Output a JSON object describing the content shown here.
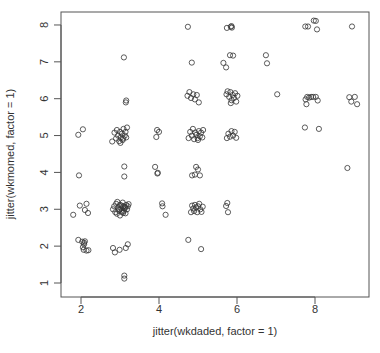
{
  "chart_data": {
    "type": "scatter",
    "title": "",
    "xlabel": "jitter(wkdaded, factor = 1)",
    "ylabel": "jitter(wkmomed, factor = 1)",
    "xlim": [
      1.5,
      9.4
    ],
    "ylim": [
      0.7,
      8.3
    ],
    "x_ticks": [
      2,
      4,
      6,
      8
    ],
    "y_ticks": [
      1,
      2,
      3,
      4,
      5,
      6,
      7,
      8
    ],
    "grid": false,
    "legend": null,
    "marker": "open-circle",
    "marker_color": "#333333",
    "points": [
      {
        "x": 1.8,
        "y": 2.85
      },
      {
        "x": 1.97,
        "y": 3.1
      },
      {
        "x": 2.1,
        "y": 2.98
      },
      {
        "x": 2.14,
        "y": 3.15
      },
      {
        "x": 2.18,
        "y": 2.9
      },
      {
        "x": 1.93,
        "y": 2.17
      },
      {
        "x": 2.03,
        "y": 2.12
      },
      {
        "x": 2.08,
        "y": 2.05
      },
      {
        "x": 2.1,
        "y": 2.13
      },
      {
        "x": 2.05,
        "y": 1.97
      },
      {
        "x": 2.07,
        "y": 1.9
      },
      {
        "x": 2.14,
        "y": 1.88
      },
      {
        "x": 2.19,
        "y": 1.89
      },
      {
        "x": 2.08,
        "y": 2.09
      },
      {
        "x": 1.95,
        "y": 3.92
      },
      {
        "x": 1.93,
        "y": 5.02
      },
      {
        "x": 2.05,
        "y": 5.17
      },
      {
        "x": 2.82,
        "y": 1.95
      },
      {
        "x": 2.87,
        "y": 1.83
      },
      {
        "x": 2.99,
        "y": 1.9
      },
      {
        "x": 3.15,
        "y": 1.95
      },
      {
        "x": 3.2,
        "y": 2.05
      },
      {
        "x": 3.11,
        "y": 1.2
      },
      {
        "x": 3.11,
        "y": 1.12
      },
      {
        "x": 2.82,
        "y": 3.0
      },
      {
        "x": 2.85,
        "y": 3.08
      },
      {
        "x": 2.88,
        "y": 2.92
      },
      {
        "x": 2.9,
        "y": 3.15
      },
      {
        "x": 2.92,
        "y": 2.88
      },
      {
        "x": 2.95,
        "y": 3.05
      },
      {
        "x": 2.97,
        "y": 2.97
      },
      {
        "x": 3.0,
        "y": 3.12
      },
      {
        "x": 3.0,
        "y": 2.83
      },
      {
        "x": 3.03,
        "y": 3.02
      },
      {
        "x": 3.05,
        "y": 2.93
      },
      {
        "x": 3.07,
        "y": 3.18
      },
      {
        "x": 3.09,
        "y": 3.08
      },
      {
        "x": 3.1,
        "y": 2.96
      },
      {
        "x": 3.12,
        "y": 3.03
      },
      {
        "x": 3.14,
        "y": 2.89
      },
      {
        "x": 3.16,
        "y": 3.12
      },
      {
        "x": 3.18,
        "y": 3.0
      },
      {
        "x": 3.2,
        "y": 3.08
      },
      {
        "x": 3.22,
        "y": 3.14
      },
      {
        "x": 2.93,
        "y": 3.2
      },
      {
        "x": 2.98,
        "y": 3.0
      },
      {
        "x": 3.04,
        "y": 3.1
      },
      {
        "x": 3.08,
        "y": 2.9
      },
      {
        "x": 3.13,
        "y": 3.06
      },
      {
        "x": 3.11,
        "y": 3.89
      },
      {
        "x": 3.11,
        "y": 4.16
      },
      {
        "x": 2.8,
        "y": 4.84
      },
      {
        "x": 2.86,
        "y": 5.08
      },
      {
        "x": 2.9,
        "y": 4.92
      },
      {
        "x": 2.92,
        "y": 5.15
      },
      {
        "x": 2.95,
        "y": 5.0
      },
      {
        "x": 2.98,
        "y": 4.85
      },
      {
        "x": 3.0,
        "y": 5.1
      },
      {
        "x": 3.02,
        "y": 4.95
      },
      {
        "x": 3.05,
        "y": 5.05
      },
      {
        "x": 3.07,
        "y": 4.88
      },
      {
        "x": 3.09,
        "y": 5.18
      },
      {
        "x": 3.12,
        "y": 5.0
      },
      {
        "x": 3.14,
        "y": 5.1
      },
      {
        "x": 3.16,
        "y": 4.95
      },
      {
        "x": 3.18,
        "y": 5.22
      },
      {
        "x": 3.01,
        "y": 4.8
      },
      {
        "x": 3.08,
        "y": 4.92
      },
      {
        "x": 3.15,
        "y": 5.9
      },
      {
        "x": 3.16,
        "y": 5.95
      },
      {
        "x": 3.1,
        "y": 7.12
      },
      {
        "x": 3.9,
        "y": 4.15
      },
      {
        "x": 3.96,
        "y": 3.97
      },
      {
        "x": 3.97,
        "y": 3.99
      },
      {
        "x": 4.08,
        "y": 3.16
      },
      {
        "x": 4.09,
        "y": 3.08
      },
      {
        "x": 4.17,
        "y": 2.85
      },
      {
        "x": 3.93,
        "y": 4.96
      },
      {
        "x": 3.95,
        "y": 5.15
      },
      {
        "x": 4.0,
        "y": 5.1
      },
      {
        "x": 4.75,
        "y": 2.17
      },
      {
        "x": 5.08,
        "y": 1.92
      },
      {
        "x": 4.82,
        "y": 2.92
      },
      {
        "x": 4.85,
        "y": 3.1
      },
      {
        "x": 4.88,
        "y": 3.02
      },
      {
        "x": 4.9,
        "y": 2.95
      },
      {
        "x": 4.92,
        "y": 3.12
      },
      {
        "x": 4.95,
        "y": 3.05
      },
      {
        "x": 4.98,
        "y": 2.92
      },
      {
        "x": 5.0,
        "y": 3.08
      },
      {
        "x": 5.03,
        "y": 3.15
      },
      {
        "x": 5.06,
        "y": 3.0
      },
      {
        "x": 5.09,
        "y": 2.93
      },
      {
        "x": 5.12,
        "y": 3.07
      },
      {
        "x": 4.85,
        "y": 3.92
      },
      {
        "x": 4.95,
        "y": 4.15
      },
      {
        "x": 5.0,
        "y": 4.08
      },
      {
        "x": 5.05,
        "y": 3.92
      },
      {
        "x": 4.92,
        "y": 3.94
      },
      {
        "x": 4.76,
        "y": 4.93
      },
      {
        "x": 4.8,
        "y": 5.1
      },
      {
        "x": 4.84,
        "y": 5.0
      },
      {
        "x": 4.87,
        "y": 5.18
      },
      {
        "x": 4.9,
        "y": 4.9
      },
      {
        "x": 4.93,
        "y": 5.08
      },
      {
        "x": 4.96,
        "y": 5.02
      },
      {
        "x": 4.99,
        "y": 4.93
      },
      {
        "x": 5.02,
        "y": 5.12
      },
      {
        "x": 5.05,
        "y": 4.98
      },
      {
        "x": 5.08,
        "y": 5.08
      },
      {
        "x": 5.11,
        "y": 4.95
      },
      {
        "x": 5.13,
        "y": 5.15
      },
      {
        "x": 5.0,
        "y": 4.88
      },
      {
        "x": 4.73,
        "y": 6.08
      },
      {
        "x": 4.78,
        "y": 6.18
      },
      {
        "x": 4.82,
        "y": 6.02
      },
      {
        "x": 4.88,
        "y": 6.12
      },
      {
        "x": 4.92,
        "y": 5.98
      },
      {
        "x": 4.97,
        "y": 6.1
      },
      {
        "x": 5.02,
        "y": 5.9
      },
      {
        "x": 4.74,
        "y": 7.95
      },
      {
        "x": 4.84,
        "y": 6.98
      },
      {
        "x": 5.65,
        "y": 6.97
      },
      {
        "x": 5.82,
        "y": 7.18
      },
      {
        "x": 5.9,
        "y": 7.17
      },
      {
        "x": 5.72,
        "y": 6.85
      },
      {
        "x": 5.74,
        "y": 7.92
      },
      {
        "x": 5.84,
        "y": 7.95
      },
      {
        "x": 5.86,
        "y": 7.97
      },
      {
        "x": 5.87,
        "y": 7.93
      },
      {
        "x": 5.73,
        "y": 6.12
      },
      {
        "x": 5.76,
        "y": 6.2
      },
      {
        "x": 5.8,
        "y": 6.05
      },
      {
        "x": 5.83,
        "y": 6.18
      },
      {
        "x": 5.86,
        "y": 5.96
      },
      {
        "x": 5.89,
        "y": 6.1
      },
      {
        "x": 5.92,
        "y": 6.02
      },
      {
        "x": 5.95,
        "y": 6.15
      },
      {
        "x": 5.98,
        "y": 5.92
      },
      {
        "x": 6.01,
        "y": 6.08
      },
      {
        "x": 5.84,
        "y": 5.88
      },
      {
        "x": 5.74,
        "y": 4.93
      },
      {
        "x": 5.78,
        "y": 5.05
      },
      {
        "x": 5.82,
        "y": 4.97
      },
      {
        "x": 5.86,
        "y": 5.12
      },
      {
        "x": 5.9,
        "y": 5.0
      },
      {
        "x": 5.94,
        "y": 5.1
      },
      {
        "x": 5.98,
        "y": 4.94
      },
      {
        "x": 5.72,
        "y": 3.09
      },
      {
        "x": 5.75,
        "y": 3.17
      },
      {
        "x": 5.77,
        "y": 2.92
      },
      {
        "x": 6.74,
        "y": 7.18
      },
      {
        "x": 6.77,
        "y": 6.96
      },
      {
        "x": 7.03,
        "y": 6.12
      },
      {
        "x": 7.75,
        "y": 7.96
      },
      {
        "x": 7.82,
        "y": 7.96
      },
      {
        "x": 7.97,
        "y": 8.12
      },
      {
        "x": 8.02,
        "y": 8.11
      },
      {
        "x": 8.05,
        "y": 7.88
      },
      {
        "x": 7.76,
        "y": 5.98
      },
      {
        "x": 7.8,
        "y": 6.05
      },
      {
        "x": 7.85,
        "y": 6.03
      },
      {
        "x": 7.9,
        "y": 6.05
      },
      {
        "x": 7.95,
        "y": 6.05
      },
      {
        "x": 8.02,
        "y": 6.05
      },
      {
        "x": 8.07,
        "y": 5.95
      },
      {
        "x": 7.78,
        "y": 5.85
      },
      {
        "x": 7.74,
        "y": 5.22
      },
      {
        "x": 8.1,
        "y": 5.18
      },
      {
        "x": 8.95,
        "y": 7.96
      },
      {
        "x": 8.83,
        "y": 4.12
      },
      {
        "x": 8.88,
        "y": 6.04
      },
      {
        "x": 8.93,
        "y": 5.92
      },
      {
        "x": 9.02,
        "y": 6.05
      },
      {
        "x": 9.08,
        "y": 5.85
      }
    ]
  }
}
